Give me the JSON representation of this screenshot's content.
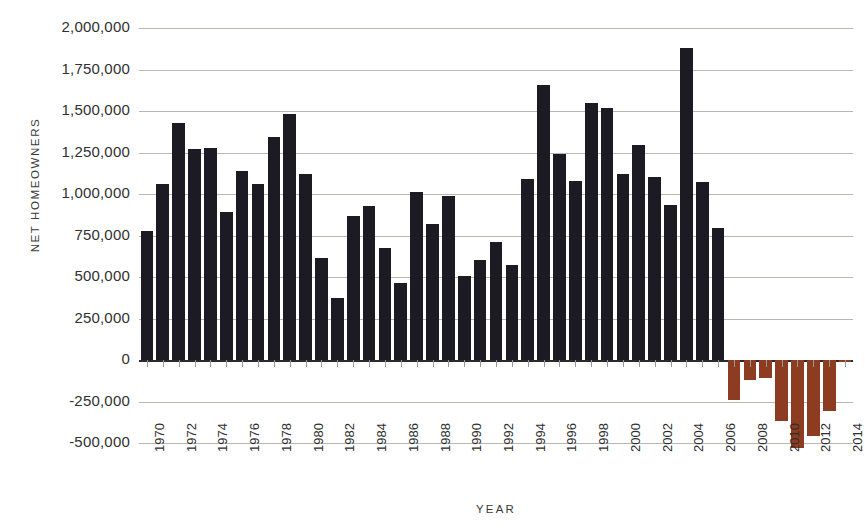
{
  "chart_data": {
    "type": "bar",
    "title": "",
    "xlabel": "YEAR",
    "ylabel": "NET HOMEOWNERS",
    "ylim": [
      -500000,
      2000000
    ],
    "ytick_values": [
      2000000,
      1750000,
      1500000,
      1250000,
      1000000,
      750000,
      500000,
      250000,
      0,
      -250000,
      -500000
    ],
    "ytick_labels": [
      "2,000,000",
      "1,750,000",
      "1,500,000",
      "1,250,000",
      "1,000,000",
      "750,000",
      "500,000",
      "250,000",
      "0",
      "-250,000",
      "-500,000"
    ],
    "grid": true,
    "legend": "none",
    "xtick_labels": [
      "1970",
      "1972",
      "1974",
      "1976",
      "1978",
      "1980",
      "1982",
      "1984",
      "1986",
      "1988",
      "1990",
      "1992",
      "1994",
      "1996",
      "1998",
      "2000",
      "2002",
      "2004",
      "2006",
      "2008",
      "2010",
      "2012",
      "2014"
    ],
    "xtick_step_years": 2,
    "colors": {
      "positive_bar": "#1c1a22",
      "negative_bar": "#8d3c22",
      "gridline": "#b9b7b2",
      "axis": "#2b2b2b",
      "text": "#2e2e2e",
      "background": "#ffffff"
    },
    "categories": [
      1970,
      1971,
      1972,
      1973,
      1974,
      1975,
      1976,
      1977,
      1978,
      1979,
      1980,
      1981,
      1982,
      1983,
      1984,
      1985,
      1986,
      1987,
      1988,
      1989,
      1990,
      1991,
      1992,
      1993,
      1994,
      1995,
      1996,
      1997,
      1998,
      1999,
      2000,
      2001,
      2002,
      2003,
      2004,
      2005,
      2006,
      2007,
      2008,
      2009,
      2010,
      2011,
      2012,
      2013,
      2014
    ],
    "values": [
      780000,
      1060000,
      1430000,
      1270000,
      1275000,
      890000,
      1140000,
      1060000,
      1345000,
      1480000,
      1120000,
      615000,
      375000,
      865000,
      925000,
      675000,
      465000,
      1010000,
      820000,
      990000,
      505000,
      600000,
      710000,
      575000,
      1090000,
      1655000,
      1240000,
      1080000,
      1550000,
      1520000,
      1120000,
      1295000,
      1105000,
      935000,
      1880000,
      1070000,
      795000,
      -240000,
      -120000,
      -110000,
      -370000,
      -530000,
      -460000,
      -310000,
      -15000
    ]
  }
}
